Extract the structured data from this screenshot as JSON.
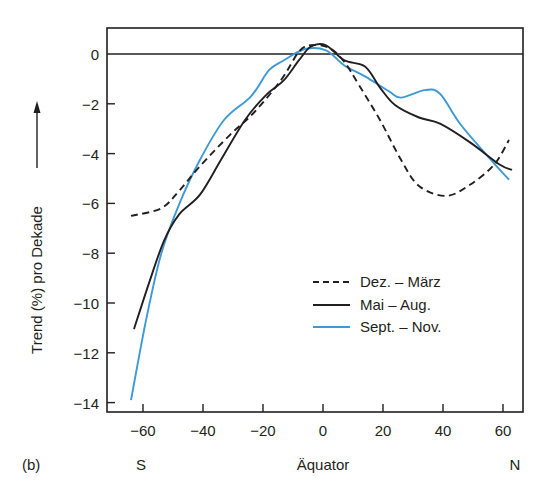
{
  "chart_data": {
    "type": "line",
    "panel_label": "(b)",
    "title": "",
    "xlabel": "Äquator",
    "xlabel_left": "S",
    "xlabel_right": "N",
    "ylabel": "Trend (%) pro Dekade",
    "xlim": [
      -70,
      67
    ],
    "ylim": [
      -14.4,
      1.05
    ],
    "xticks": [
      -60,
      -40,
      -20,
      0,
      20,
      40,
      60
    ],
    "xtick_labels": [
      "−60",
      "−40",
      "−20",
      "0",
      "20",
      "40",
      "60"
    ],
    "yticks": [
      0,
      -2,
      -4,
      -6,
      -8,
      -10,
      -12,
      -14
    ],
    "ytick_labels": [
      "0",
      "−2",
      "−4",
      "−6",
      "−8",
      "−10",
      "−12",
      "−14"
    ],
    "reference_line_y": 0,
    "grid": false,
    "legend_position": "bottom-right-inside",
    "series": [
      {
        "name": "Dez. – März",
        "style": "dashed",
        "color": "#231f20",
        "x": [
          -64,
          -54,
          -48,
          -41,
          -31,
          -23,
          -14,
          -8,
          -4,
          2,
          7,
          12,
          19,
          26,
          32,
          41,
          49,
          57,
          62
        ],
        "y": [
          -6.5,
          -6.2,
          -5.5,
          -4.5,
          -3.25,
          -2.35,
          -1.05,
          0.1,
          0.35,
          0.25,
          -0.3,
          -1.25,
          -2.65,
          -4.25,
          -5.3,
          -5.7,
          -5.25,
          -4.45,
          -3.45
        ]
      },
      {
        "name": "Mai – Aug.",
        "style": "solid",
        "color": "#231f20",
        "x": [
          -63,
          -58,
          -53,
          -48,
          -41,
          -34,
          -26,
          -19,
          -13,
          -8,
          -4,
          1,
          7,
          14,
          19,
          24,
          32,
          39,
          49,
          59,
          63
        ],
        "y": [
          -11.05,
          -9.2,
          -7.5,
          -6.45,
          -5.65,
          -4.25,
          -2.65,
          -1.65,
          -1.05,
          -0.25,
          0.3,
          0.35,
          -0.25,
          -0.5,
          -1.35,
          -2.05,
          -2.55,
          -2.8,
          -3.55,
          -4.45,
          -4.65
        ]
      },
      {
        "name": "Sept. – Nov.",
        "style": "solid",
        "color": "#3d9ad6",
        "x": [
          -64,
          -59,
          -54,
          -48,
          -41,
          -33,
          -24,
          -18,
          -13,
          -6,
          1,
          7,
          14,
          22,
          26,
          34,
          39,
          46,
          56,
          62
        ],
        "y": [
          -13.9,
          -10.7,
          -8.05,
          -6.05,
          -4.25,
          -2.65,
          -1.7,
          -0.65,
          -0.25,
          0.2,
          0.15,
          -0.45,
          -0.9,
          -1.5,
          -1.75,
          -1.45,
          -1.6,
          -2.85,
          -4.25,
          -5.05
        ]
      }
    ]
  }
}
